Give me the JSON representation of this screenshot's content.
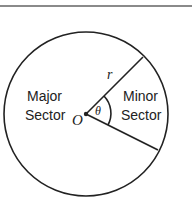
{
  "diagram": {
    "labels": {
      "major_line1": "Major",
      "major_line2": "Sector",
      "minor_line1": "Minor",
      "minor_line2": "Sector",
      "center": "O",
      "radius": "r",
      "angle": "θ"
    },
    "colors": {
      "stroke": "#222222",
      "rule": "#8a8a8a"
    }
  }
}
